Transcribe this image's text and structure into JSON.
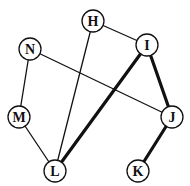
{
  "diagram": {
    "type": "graph",
    "colors": {
      "stroke": "#111111",
      "node_fill": "#ffffff",
      "background": "#ffffff"
    },
    "nodes": [
      {
        "id": "H",
        "label": "H",
        "x": 93,
        "y": 21
      },
      {
        "id": "I",
        "label": "I",
        "x": 147,
        "y": 45
      },
      {
        "id": "N",
        "label": "N",
        "x": 30,
        "y": 49
      },
      {
        "id": "M",
        "label": "M",
        "x": 19,
        "y": 117
      },
      {
        "id": "J",
        "label": "J",
        "x": 172,
        "y": 117
      },
      {
        "id": "L",
        "label": "L",
        "x": 55,
        "y": 171
      },
      {
        "id": "K",
        "label": "K",
        "x": 138,
        "y": 171
      }
    ],
    "edges": [
      {
        "from": "H",
        "to": "I",
        "weight": "thin"
      },
      {
        "from": "H",
        "to": "L",
        "weight": "thin"
      },
      {
        "from": "N",
        "to": "M",
        "weight": "thin"
      },
      {
        "from": "N",
        "to": "J",
        "weight": "thin"
      },
      {
        "from": "M",
        "to": "L",
        "weight": "thin"
      },
      {
        "from": "I",
        "to": "L",
        "weight": "thick"
      },
      {
        "from": "I",
        "to": "J",
        "weight": "thick"
      },
      {
        "from": "J",
        "to": "K",
        "weight": "thick"
      }
    ]
  }
}
